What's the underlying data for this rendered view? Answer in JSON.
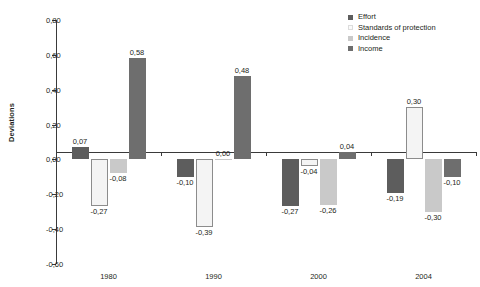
{
  "chart_data": {
    "type": "bar",
    "title": "",
    "xlabel": "",
    "ylabel": "Deviations",
    "categories": [
      "1980",
      "1990",
      "2000",
      "2004"
    ],
    "ylim": [
      -0.6,
      0.8
    ],
    "ytick_step": 0.2,
    "ytick_labels": [
      "0,80",
      "0,60",
      "0,40",
      "0,20",
      "0,00",
      "-0,20",
      "-0,40",
      "-0,60"
    ],
    "ytick_values": [
      0.8,
      0.6,
      0.4,
      0.2,
      0.0,
      -0.2,
      -0.4,
      -0.6
    ],
    "grid": false,
    "legend_position": "top-right",
    "decimal_separator": ",",
    "series": [
      {
        "name": "Effort",
        "color": "#5d5d5d",
        "values": [
          0.07,
          -0.1,
          -0.27,
          -0.19
        ],
        "labels": [
          "0,07",
          "-0,10",
          "-0,27",
          "-0,19"
        ]
      },
      {
        "name": "Standards of protection",
        "color": "#f4f4f4",
        "values": [
          -0.27,
          -0.39,
          -0.04,
          0.3
        ],
        "labels": [
          "-0,27",
          "-0,39",
          "-0,04",
          "0,30"
        ]
      },
      {
        "name": "Incidence",
        "color": "#c9c9c9",
        "values": [
          -0.08,
          0.0,
          -0.26,
          -0.3
        ],
        "labels": [
          "-0,08",
          "0,00",
          "-0,26",
          "-0,30"
        ]
      },
      {
        "name": "Income",
        "color": "#6e6e6e",
        "values": [
          0.58,
          0.48,
          0.04,
          -0.1
        ],
        "labels": [
          "0,58",
          "0,48",
          "0,04",
          "-0,10"
        ]
      }
    ]
  }
}
